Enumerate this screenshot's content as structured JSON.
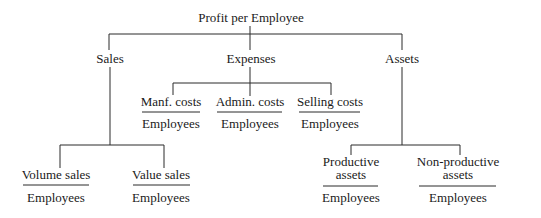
{
  "diagram": {
    "root": "Profit per Employee",
    "level1": {
      "sales": "Sales",
      "expenses": "Expenses",
      "assets": "Assets"
    },
    "expenses_children": [
      {
        "numerator": "Manf. costs",
        "denominator": "Employees"
      },
      {
        "numerator": "Admin. costs",
        "denominator": "Employees"
      },
      {
        "numerator": "Selling costs",
        "denominator": "Employees"
      }
    ],
    "sales_children": [
      {
        "numerator": "Volume sales",
        "denominator": "Employees"
      },
      {
        "numerator": "Value sales",
        "denominator": "Employees"
      }
    ],
    "assets_children": [
      {
        "numerator_line1": "Productive",
        "numerator_line2": "assets",
        "denominator": "Employees"
      },
      {
        "numerator_line1": "Non-productive",
        "numerator_line2": "assets",
        "denominator": "Employees"
      }
    ],
    "line_color": "#2a2a2a"
  }
}
